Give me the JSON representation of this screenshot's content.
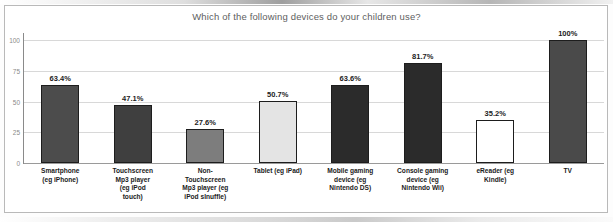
{
  "chart_data": {
    "type": "bar",
    "title": "Which of the following devices do your children use?",
    "xlabel": "",
    "ylabel": "",
    "ylim": [
      0,
      100
    ],
    "yticks": [
      0,
      25,
      50,
      75,
      100
    ],
    "ytick_labels": [
      "0",
      "25",
      "50",
      "75",
      "100"
    ],
    "grid": true,
    "legend": false,
    "categories": [
      "Smartphone (eg iPhone)",
      "Touchscreen Mp3 player (eg iPod touch)",
      "Non-Touchscreen Mp3 player (eg iPod shuffle)",
      "Tablet (eg iPad)",
      "Mobile gaming device (eg Nintendo DS)",
      "Console gaming device (eg Nintendo Wii)",
      "eReader (eg Kindle)",
      "TV"
    ],
    "category_lines": [
      [
        "Smartphone",
        "(eg iPhone)"
      ],
      [
        "Touchscreen",
        "Mp3 player",
        "(eg iPod",
        "touch)"
      ],
      [
        "Non-",
        "Touchscreen",
        "Mp3 player (eg",
        "iPod sInuffle)"
      ],
      [
        "Tablet (eg iPad)"
      ],
      [
        "Mobile gaming",
        "device (eg",
        "Nintendo DS)"
      ],
      [
        "Console gaming",
        "device (eg",
        "Nintendo Wii)"
      ],
      [
        "eReader (eg",
        "Kindle)"
      ],
      [
        "TV"
      ]
    ],
    "values": [
      63.4,
      47.1,
      27.6,
      50.7,
      63.6,
      81.7,
      35.2,
      100
    ],
    "data_labels": [
      "63.4%",
      "47.1%",
      "27.6%",
      "50.7%",
      "63.6%",
      "81.7%",
      "35.2%",
      "100%"
    ],
    "bar_colors": [
      "#4c4c4c",
      "#3f3f3f",
      "#7d7d7d",
      "#e4e4e4",
      "#2b2b2b",
      "#2b2b2b",
      "#ffffff",
      "#4a4a4a"
    ],
    "bar_border_color": "#1d1d1d",
    "gridline_color": "#d8d8d8",
    "axis_color": "#8a8a8a",
    "title_color": "#5e5e5e"
  }
}
